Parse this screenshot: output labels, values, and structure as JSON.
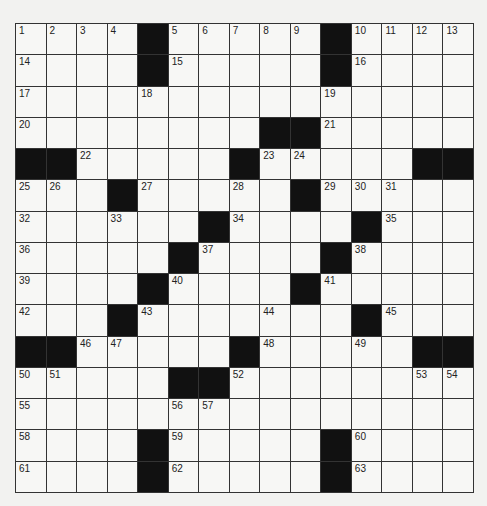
{
  "puzzle": {
    "size": 15,
    "rows": [
      "....#.....#....",
      "....#.....#....",
      "...............",
      "........##.....",
      "##.....#.....##",
      "...#.....#.....",
      "......#....#...",
      ".....#....#....",
      "....#....#.....",
      "...#.......#...",
      "##.....#.....##",
      ".....##........",
      "...............",
      "....#.....#....",
      "....#.....#...."
    ],
    "numbers": [
      {
        "n": "1",
        "r": 0,
        "c": 0
      },
      {
        "n": "2",
        "r": 0,
        "c": 1
      },
      {
        "n": "3",
        "r": 0,
        "c": 2
      },
      {
        "n": "4",
        "r": 0,
        "c": 3
      },
      {
        "n": "5",
        "r": 0,
        "c": 5
      },
      {
        "n": "6",
        "r": 0,
        "c": 6
      },
      {
        "n": "7",
        "r": 0,
        "c": 7
      },
      {
        "n": "8",
        "r": 0,
        "c": 8
      },
      {
        "n": "9",
        "r": 0,
        "c": 9
      },
      {
        "n": "10",
        "r": 0,
        "c": 11
      },
      {
        "n": "11",
        "r": 0,
        "c": 12
      },
      {
        "n": "12",
        "r": 0,
        "c": 13
      },
      {
        "n": "13",
        "r": 0,
        "c": 14
      },
      {
        "n": "14",
        "r": 1,
        "c": 0
      },
      {
        "n": "15",
        "r": 1,
        "c": 5
      },
      {
        "n": "16",
        "r": 1,
        "c": 11
      },
      {
        "n": "17",
        "r": 2,
        "c": 0
      },
      {
        "n": "18",
        "r": 2,
        "c": 4
      },
      {
        "n": "19",
        "r": 2,
        "c": 10
      },
      {
        "n": "20",
        "r": 3,
        "c": 0
      },
      {
        "n": "21",
        "r": 3,
        "c": 10
      },
      {
        "n": "22",
        "r": 4,
        "c": 2
      },
      {
        "n": "23",
        "r": 4,
        "c": 8
      },
      {
        "n": "24",
        "r": 4,
        "c": 9
      },
      {
        "n": "25",
        "r": 5,
        "c": 0
      },
      {
        "n": "26",
        "r": 5,
        "c": 1
      },
      {
        "n": "27",
        "r": 5,
        "c": 4
      },
      {
        "n": "28",
        "r": 5,
        "c": 7
      },
      {
        "n": "29",
        "r": 5,
        "c": 10
      },
      {
        "n": "30",
        "r": 5,
        "c": 11
      },
      {
        "n": "31",
        "r": 5,
        "c": 12
      },
      {
        "n": "32",
        "r": 6,
        "c": 0
      },
      {
        "n": "33",
        "r": 6,
        "c": 3
      },
      {
        "n": "34",
        "r": 6,
        "c": 7
      },
      {
        "n": "35",
        "r": 6,
        "c": 12
      },
      {
        "n": "36",
        "r": 7,
        "c": 0
      },
      {
        "n": "37",
        "r": 7,
        "c": 6
      },
      {
        "n": "38",
        "r": 7,
        "c": 11
      },
      {
        "n": "39",
        "r": 8,
        "c": 0
      },
      {
        "n": "40",
        "r": 8,
        "c": 5
      },
      {
        "n": "41",
        "r": 8,
        "c": 10
      },
      {
        "n": "42",
        "r": 9,
        "c": 0
      },
      {
        "n": "43",
        "r": 9,
        "c": 4
      },
      {
        "n": "44",
        "r": 9,
        "c": 8
      },
      {
        "n": "45",
        "r": 9,
        "c": 12
      },
      {
        "n": "46",
        "r": 10,
        "c": 2
      },
      {
        "n": "47",
        "r": 10,
        "c": 3
      },
      {
        "n": "48",
        "r": 10,
        "c": 8
      },
      {
        "n": "49",
        "r": 10,
        "c": 11
      },
      {
        "n": "50",
        "r": 11,
        "c": 0
      },
      {
        "n": "51",
        "r": 11,
        "c": 1
      },
      {
        "n": "52",
        "r": 11,
        "c": 7
      },
      {
        "n": "53",
        "r": 11,
        "c": 13
      },
      {
        "n": "54",
        "r": 11,
        "c": 14
      },
      {
        "n": "55",
        "r": 12,
        "c": 0
      },
      {
        "n": "56",
        "r": 12,
        "c": 5
      },
      {
        "n": "57",
        "r": 12,
        "c": 6
      },
      {
        "n": "58",
        "r": 13,
        "c": 0
      },
      {
        "n": "59",
        "r": 13,
        "c": 5
      },
      {
        "n": "60",
        "r": 13,
        "c": 11
      },
      {
        "n": "61",
        "r": 14,
        "c": 0
      },
      {
        "n": "62",
        "r": 14,
        "c": 5
      },
      {
        "n": "63",
        "r": 14,
        "c": 11
      }
    ],
    "colors": {
      "black": "#111111",
      "white": "#f7f7f5",
      "line": "#333333"
    }
  }
}
